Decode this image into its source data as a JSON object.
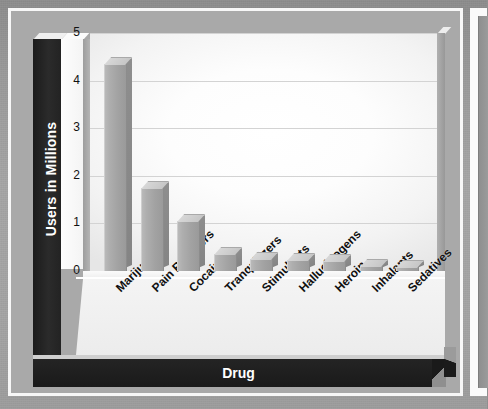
{
  "page": {
    "background_color": "#9a9a9a",
    "panel_border_color": "#f7f7f7",
    "panel_fill_color": "#a9a9a9"
  },
  "chart_data": {
    "type": "bar",
    "title": "",
    "subtitle": "",
    "xlabel": "Drug",
    "ylabel": "Users in Millions",
    "categories": [
      "Marijuana",
      "Pain Relievers",
      "Cocaine",
      "Tranquilizers",
      "Stimulants",
      "Hallucinogens",
      "Heroin",
      "Inhalants",
      "Sedatives"
    ],
    "values": [
      4.35,
      1.75,
      1.05,
      0.35,
      0.26,
      0.24,
      0.21,
      0.1,
      0.08
    ],
    "ylim": [
      0,
      5
    ],
    "yticks": [
      0,
      1,
      2,
      3,
      4,
      5
    ],
    "ytick_labels": [
      "0",
      "1",
      "2",
      "3",
      "4",
      "5"
    ],
    "grid": true,
    "grid_axis": "y",
    "legend": false,
    "legend_position": "none",
    "style": "3d-column",
    "bar_color": "#a8a8a8",
    "bar_top_color": "#d0d0d0",
    "bar_side_color": "#8a8a8a",
    "plot_background": "#ffffff",
    "axis_title_band_color": "#1e1e1e",
    "axis_title_text_color": "#ffffff",
    "xlabel_rotation_degrees": -45
  }
}
